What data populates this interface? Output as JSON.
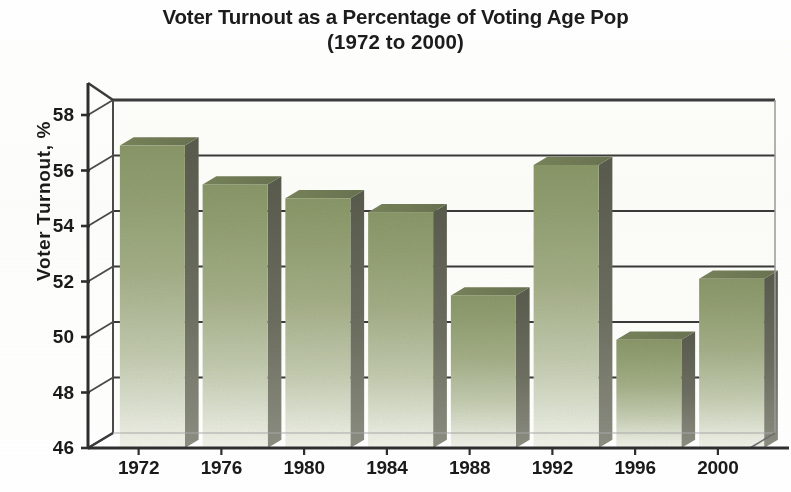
{
  "chart_data": {
    "type": "bar",
    "title": "Voter Turnout as a Percentage of Voting Age Pop",
    "subtitle": "(1972 to 2000)",
    "xlabel": "",
    "ylabel": "Voter Turnout, %",
    "categories": [
      "1972",
      "1976",
      "1980",
      "1984",
      "1988",
      "1992",
      "1996",
      "2000"
    ],
    "values": [
      56.9,
      55.5,
      55.0,
      54.5,
      51.5,
      56.2,
      49.9,
      52.1
    ],
    "ylim": [
      46,
      58
    ],
    "yticks": [
      46,
      48,
      50,
      52,
      54,
      56,
      58
    ],
    "ytick_labels": [
      "46",
      "48",
      "50",
      "52",
      "54",
      "56",
      "58"
    ],
    "grid": "horizontal",
    "legend": "none",
    "series": [
      {
        "name": "Voter Turnout",
        "values": [
          56.9,
          55.5,
          55.0,
          54.5,
          51.5,
          56.2,
          49.9,
          52.1
        ]
      }
    ],
    "colors": {
      "bar_top": "#8d9a6b",
      "bar_bottom": "#f2f3ea",
      "bar_side": "#4d4f44",
      "axis": "#333333",
      "gridline": "#3a3a3a",
      "text": "#1a1a1a",
      "background": "#fefefe"
    },
    "style": "3d-bar-perspective"
  }
}
